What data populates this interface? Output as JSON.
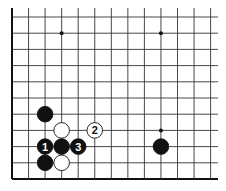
{
  "diagram": {
    "type": "go-board-fragment",
    "grid": {
      "x0": 12,
      "y0": 17,
      "dx": 16.55,
      "dy": 16.2,
      "cols": 13,
      "rows": 11,
      "right_extent": 218,
      "top_extent": 8,
      "left_edge": true,
      "bottom_edge": true
    },
    "star_points": [
      {
        "col": 3,
        "row": 1
      },
      {
        "col": 9,
        "row": 1
      },
      {
        "col": 9,
        "row": 7
      }
    ],
    "stones": [
      {
        "col": 2,
        "row": 6,
        "color": "black",
        "label": ""
      },
      {
        "col": 3,
        "row": 7,
        "color": "white",
        "label": ""
      },
      {
        "col": 5,
        "row": 7,
        "color": "white",
        "label": "2"
      },
      {
        "col": 2,
        "row": 8,
        "color": "black",
        "label": "1"
      },
      {
        "col": 3,
        "row": 8,
        "color": "black",
        "label": ""
      },
      {
        "col": 4,
        "row": 8,
        "color": "black",
        "label": "3"
      },
      {
        "col": 2,
        "row": 9,
        "color": "black",
        "label": ""
      },
      {
        "col": 3,
        "row": 9,
        "color": "white",
        "label": ""
      },
      {
        "col": 9,
        "row": 8,
        "color": "black",
        "label": ""
      }
    ],
    "colors": {
      "line": "#333333",
      "edge": "#111111",
      "black": "#111111",
      "white": "#ffffff"
    }
  }
}
